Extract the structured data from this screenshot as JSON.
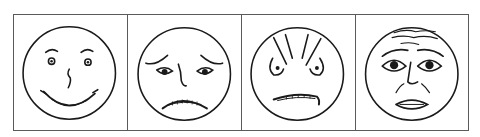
{
  "figure": {
    "panels": [
      {
        "id": "happy",
        "label": "Happy face"
      },
      {
        "id": "sad",
        "label": "Sad / worried face"
      },
      {
        "id": "angry",
        "label": "Angry face"
      },
      {
        "id": "afraid",
        "label": "Afraid / distressed face"
      }
    ],
    "colors": {
      "border": "#5a5a5a",
      "ink": "#1a1a1a",
      "background": "#ffffff"
    }
  }
}
